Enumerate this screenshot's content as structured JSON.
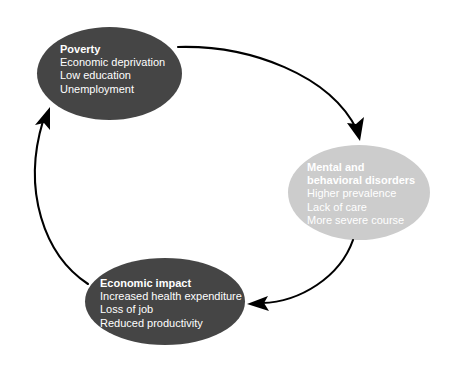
{
  "diagram": {
    "type": "cycle-diagram",
    "background_color": "#ffffff",
    "nodes": [
      {
        "id": "poverty",
        "title": "Poverty",
        "items": [
          "Economic deprivation",
          "Low education",
          "Unemployment"
        ],
        "fill_color": "#454545",
        "text_color": "#ffffff"
      },
      {
        "id": "mental",
        "title_line1": "Mental and",
        "title_line2": "behavioral disorders",
        "items": [
          "Higher prevalence",
          "Lack of care",
          "More severe course"
        ],
        "fill_color": "#cccccc",
        "text_color": "#ffffff"
      },
      {
        "id": "impact",
        "title": "Economic impact",
        "items": [
          "Increased health expenditure",
          "Loss of job",
          "Reduced productivity"
        ],
        "fill_color": "#454545",
        "text_color": "#ffffff"
      }
    ],
    "arrows": [
      {
        "id": "poverty-to-mental",
        "from": "poverty",
        "to": "mental",
        "color": "#000000"
      },
      {
        "id": "mental-to-impact",
        "from": "mental",
        "to": "impact",
        "color": "#000000"
      },
      {
        "id": "impact-to-poverty",
        "from": "impact",
        "to": "poverty",
        "color": "#000000"
      }
    ]
  }
}
